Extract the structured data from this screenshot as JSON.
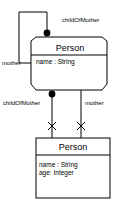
{
  "diagram": {
    "type": "uml-class-diagram",
    "stroke_color": "#000000",
    "fill_color": "#ffffff",
    "classes": [
      {
        "id": "person-top",
        "name": "Person",
        "shape": "chamfered-rectangle",
        "attributes": [
          "name : String"
        ]
      },
      {
        "id": "person-bottom",
        "name": "Person",
        "shape": "rectangle",
        "attributes": [
          "name : String",
          "age: Integer"
        ]
      }
    ],
    "associations": [
      {
        "id": "self-association",
        "source": "person-top",
        "target": "person-top",
        "kind": "self-loop",
        "source_role": "childOfMother",
        "target_role": "mother",
        "source_end_marker": "filled-dot"
      },
      {
        "id": "association-child",
        "source": "person-top",
        "target": "person-bottom",
        "source_role": "childOfMother",
        "source_end_marker": "filled-dot",
        "target_end_marker": "cross"
      },
      {
        "id": "association-mother",
        "source": "person-top",
        "target": "person-bottom",
        "source_role": "mother",
        "target_end_marker": "cross"
      }
    ],
    "labels": {
      "role_child_top": "childOfMother",
      "role_mother_left": "mother",
      "role_child_bottom": "childOfMother",
      "role_mother_bottom": "mother"
    }
  }
}
